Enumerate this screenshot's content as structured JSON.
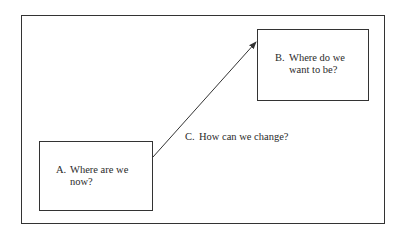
{
  "diagram": {
    "box_a": {
      "letter": "A.",
      "line1": "Where are we",
      "line2": "now?"
    },
    "box_b": {
      "letter": "B.",
      "line1": "Where do we",
      "line2": "want to be?"
    },
    "arrow_label": {
      "letter": "C.",
      "text": "How can we change?"
    },
    "colors": {
      "stroke": "#333333",
      "text": "#2a2a2a",
      "background": "#ffffff"
    }
  }
}
